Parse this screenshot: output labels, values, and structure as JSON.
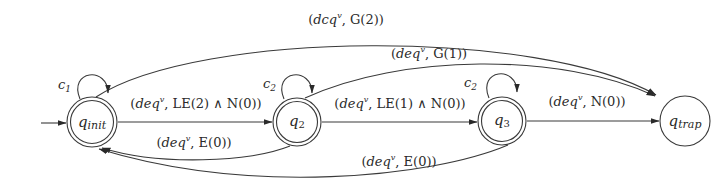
{
  "diagram": {
    "type": "finite-state-automaton",
    "states": [
      {
        "id": "q_init",
        "label": "q",
        "sub": "init",
        "accepting": true,
        "initial": true
      },
      {
        "id": "q_2",
        "label": "q",
        "sub": "2",
        "accepting": true,
        "initial": false
      },
      {
        "id": "q_3",
        "label": "q",
        "sub": "3",
        "accepting": true,
        "initial": false
      },
      {
        "id": "q_trap",
        "label": "q",
        "sub": "trap",
        "accepting": false,
        "initial": false
      }
    ],
    "self_loops": [
      {
        "state": "q_init",
        "label": "c",
        "sub": "1"
      },
      {
        "state": "q_2",
        "label": "c",
        "sub": "2"
      },
      {
        "state": "q_3",
        "label": "c",
        "sub": "2"
      }
    ],
    "transitions": [
      {
        "from": "q_init",
        "to": "q_2",
        "label": "(deq^v, LE(2) ∧ N(0))",
        "pre": "(",
        "it": "deq",
        "sup": "v",
        "post": ", LE(2) ∧ N(0))"
      },
      {
        "from": "q_2",
        "to": "q_3",
        "label": "(deq^v, LE(1) ∧ N(0))",
        "pre": "(",
        "it": "deq",
        "sup": "v",
        "post": ", LE(1) ∧ N(0))"
      },
      {
        "from": "q_3",
        "to": "q_trap",
        "label": "(deq^v, N(0))",
        "pre": "(",
        "it": "deq",
        "sup": "v",
        "post": ", N(0))"
      },
      {
        "from": "q_2",
        "to": "q_init",
        "label": "(deq^v, E(0))",
        "pre": "(",
        "it": "deq",
        "sup": "v",
        "post": ", E(0))"
      },
      {
        "from": "q_3",
        "to": "q_init",
        "label": "(deq^v, E(0))",
        "pre": "(",
        "it": "deq",
        "sup": "v",
        "post": ", E(0))"
      },
      {
        "from": "q_2",
        "to": "q_trap",
        "label": "(deq^v, G(1))",
        "pre": "(",
        "it": "deq",
        "sup": "v",
        "post": ", G(1))"
      },
      {
        "from": "q_init",
        "to": "q_trap",
        "label": "(dcq^v, G(2))",
        "pre": "(",
        "it": "dcq",
        "sup": "v",
        "post": ", G(2))"
      }
    ]
  }
}
